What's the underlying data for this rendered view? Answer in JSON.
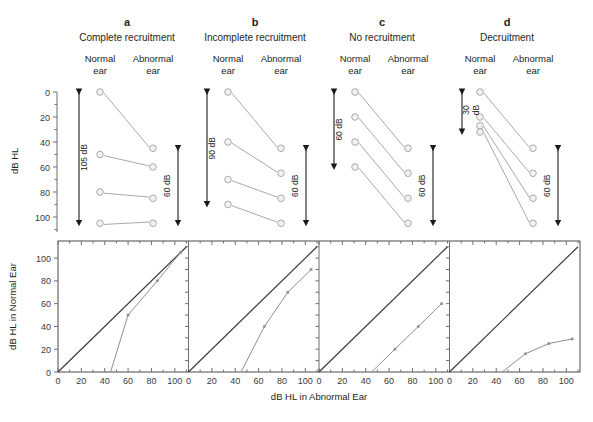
{
  "figure": {
    "type": "scientific-figure",
    "colors": {
      "marker_fill": "#f2f2f2",
      "marker_stroke": "#a9a9a9",
      "connector": "#a9a9a9",
      "diagonal": "#3c3c3c",
      "curve": "#8f8f8f",
      "axis": "#6f6f6f",
      "text": "#231f20",
      "background": "#ffffff"
    }
  },
  "top_row": {
    "y_axis_title": "dB HL",
    "y_ticks": [
      0,
      20,
      40,
      60,
      80,
      100
    ],
    "y_min": 0,
    "y_max": 112,
    "column_labels": [
      "Normal\near",
      "Abnormal\near"
    ],
    "column_label_normal_line1": "Normal",
    "column_label_normal_line2": "ear",
    "column_label_abnormal_line1": "Abnormal",
    "column_label_abnormal_line2": "ear",
    "panels": [
      {
        "letter": "a",
        "title": "Complete recruitment",
        "normal_ear": [
          0,
          50,
          80,
          105
        ],
        "abnormal_ear": [
          45,
          60,
          85,
          105
        ],
        "left_annotation": "105 dB",
        "left_range": [
          0,
          105
        ],
        "right_annotation": "60 dB",
        "right_range": [
          45,
          105
        ]
      },
      {
        "letter": "b",
        "title": "Incomplete recruitment",
        "normal_ear": [
          0,
          40,
          70,
          90
        ],
        "abnormal_ear": [
          45,
          65,
          85,
          105
        ],
        "left_annotation": "90 dB",
        "left_range": [
          0,
          90
        ],
        "right_annotation": "60 dB",
        "right_range": [
          45,
          105
        ]
      },
      {
        "letter": "c",
        "title": "No recruitment",
        "normal_ear": [
          0,
          20,
          40,
          60
        ],
        "abnormal_ear": [
          45,
          65,
          85,
          105
        ],
        "left_annotation": "60 dB",
        "left_range": [
          0,
          60
        ],
        "right_annotation": "60 dB",
        "right_range": [
          45,
          105
        ]
      },
      {
        "letter": "d",
        "title": "Decruitment",
        "normal_ear": [
          0,
          20,
          27,
          32
        ],
        "abnormal_ear": [
          45,
          65,
          85,
          105
        ],
        "left_annotation_line1": "30",
        "left_annotation_line2": "dB",
        "left_annotation": "30 dB",
        "left_range": [
          0,
          32
        ],
        "right_annotation": "60 dB",
        "right_range": [
          45,
          105
        ]
      }
    ]
  },
  "bottom_row": {
    "y_axis_title": "dB HL in Normal Ear",
    "x_axis_title": "dB HL in Abnormal Ear",
    "x_ticks": [
      0,
      20,
      40,
      60,
      80,
      100
    ],
    "y_ticks": [
      0,
      20,
      40,
      60,
      80,
      100
    ],
    "x_min": 0,
    "x_max": 110,
    "y_min": 0,
    "y_max": 115,
    "reference_line_label": "diagonal equal-loudness reference",
    "panels": [
      {
        "letter": "a",
        "name": "complete-recruitment",
        "reference": [
          [
            0,
            0
          ],
          [
            110,
            110
          ]
        ],
        "curve": [
          [
            45,
            0
          ],
          [
            60,
            50
          ],
          [
            85,
            80
          ],
          [
            105,
            105
          ]
        ]
      },
      {
        "letter": "b",
        "name": "incomplete-recruitment",
        "reference": [
          [
            0,
            0
          ],
          [
            110,
            110
          ]
        ],
        "curve": [
          [
            45,
            0
          ],
          [
            65,
            40
          ],
          [
            85,
            70
          ],
          [
            105,
            90
          ]
        ]
      },
      {
        "letter": "c",
        "name": "no-recruitment",
        "reference": [
          [
            0,
            0
          ],
          [
            110,
            110
          ]
        ],
        "curve": [
          [
            45,
            0
          ],
          [
            65,
            20
          ],
          [
            85,
            40
          ],
          [
            105,
            60
          ]
        ]
      },
      {
        "letter": "d",
        "name": "decruitment",
        "reference": [
          [
            0,
            0
          ],
          [
            110,
            110
          ]
        ],
        "curve": [
          [
            45,
            0
          ],
          [
            65,
            16
          ],
          [
            85,
            25
          ],
          [
            105,
            29
          ]
        ]
      }
    ]
  },
  "chart_data": {
    "type": "line",
    "xlabel": "dB HL in Abnormal Ear",
    "ylabel": "dB HL in Normal Ear",
    "xlim": [
      0,
      110
    ],
    "ylim": [
      0,
      115
    ],
    "grid": false,
    "legend_position": "none",
    "series": [
      {
        "name": "a — Complete recruitment",
        "x": [
          45,
          60,
          85,
          105
        ],
        "y": [
          0,
          50,
          80,
          105
        ]
      },
      {
        "name": "b — Incomplete recruitment",
        "x": [
          45,
          65,
          85,
          105
        ],
        "y": [
          0,
          40,
          70,
          90
        ]
      },
      {
        "name": "c — No recruitment",
        "x": [
          45,
          65,
          85,
          105
        ],
        "y": [
          0,
          20,
          40,
          60
        ]
      },
      {
        "name": "d — Decruitment",
        "x": [
          45,
          65,
          85,
          105
        ],
        "y": [
          0,
          16,
          25,
          29
        ]
      }
    ],
    "reference_series": {
      "name": "equal loudness diagonal",
      "x": [
        0,
        110
      ],
      "y": [
        0,
        110
      ]
    },
    "laddergram": {
      "type": "table",
      "ylabel": "dB HL",
      "ylim": [
        0,
        112
      ],
      "categories": [
        "Normal ear",
        "Abnormal ear"
      ],
      "panels": [
        {
          "label": "a",
          "title": "Complete recruitment",
          "normal": [
            0,
            50,
            80,
            105
          ],
          "abnormal": [
            45,
            60,
            85,
            105
          ],
          "range_normal_db": 105,
          "range_abnormal_db": 60
        },
        {
          "label": "b",
          "title": "Incomplete recruitment",
          "normal": [
            0,
            40,
            70,
            90
          ],
          "abnormal": [
            45,
            65,
            85,
            105
          ],
          "range_normal_db": 90,
          "range_abnormal_db": 60
        },
        {
          "label": "c",
          "title": "No recruitment",
          "normal": [
            0,
            20,
            40,
            60
          ],
          "abnormal": [
            45,
            65,
            85,
            105
          ],
          "range_normal_db": 60,
          "range_abnormal_db": 60
        },
        {
          "label": "d",
          "title": "Decruitment",
          "normal": [
            0,
            20,
            27,
            32
          ],
          "abnormal": [
            45,
            65,
            85,
            105
          ],
          "range_normal_db": 30,
          "range_abnormal_db": 60
        }
      ]
    }
  }
}
